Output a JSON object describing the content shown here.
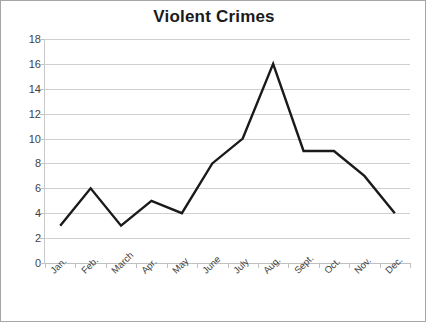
{
  "chart_data": {
    "type": "line",
    "title": "Violent Crimes",
    "xlabel": "",
    "ylabel": "",
    "categories": [
      "Jan.",
      "Feb.",
      "March",
      "Apr.",
      "May",
      "June",
      "July",
      "Aug.",
      "Sept.",
      "Oct.",
      "Nov.",
      "Dec."
    ],
    "values": [
      3,
      6,
      3,
      5,
      4,
      8,
      10,
      16,
      9,
      9,
      7,
      4
    ],
    "series": [
      {
        "name": "Violent Crimes",
        "values": [
          3,
          6,
          3,
          5,
          4,
          8,
          10,
          16,
          9,
          9,
          7,
          4
        ],
        "color": "#1a1a1a"
      }
    ],
    "ylim": [
      0,
      18
    ],
    "ytick_step": 2,
    "yticks": [
      18,
      16,
      14,
      12,
      10,
      8,
      6,
      4,
      2,
      0
    ],
    "grid": true,
    "grid_axis": "y",
    "legend": false,
    "legend_position": "none",
    "markers": false,
    "xtick_label_rotation": -45
  },
  "style": {
    "line_color": "#1a1a1a",
    "grid_color": "#d0d0d0",
    "axis_color": "#c0c0c0",
    "border_color": "#a6a6a6",
    "text_color": "#3f3f3f",
    "title_color": "#1a1a1a",
    "background": "#ffffff"
  }
}
